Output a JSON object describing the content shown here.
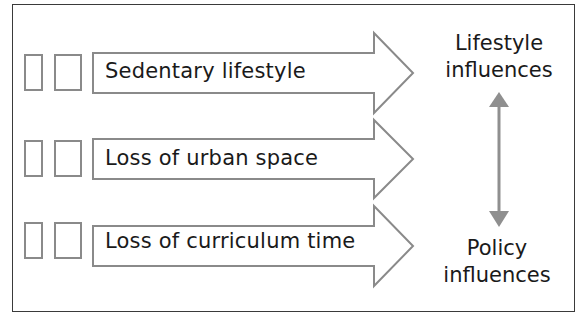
{
  "diagram": {
    "rows": [
      {
        "label": "Sedentary lifestyle"
      },
      {
        "label": "Loss of urban space"
      },
      {
        "label": "Loss of curriculum time"
      }
    ],
    "top_label": {
      "line1": "Lifestyle",
      "line2": "influences"
    },
    "bottom_label": {
      "line1": "Policy",
      "line2": "influences"
    },
    "colors": {
      "arrow_stroke": "#8a8a8a",
      "double_arrow": "#8f8f8f",
      "frame": "#3a3a3a",
      "text": "#1a1a1a"
    }
  }
}
